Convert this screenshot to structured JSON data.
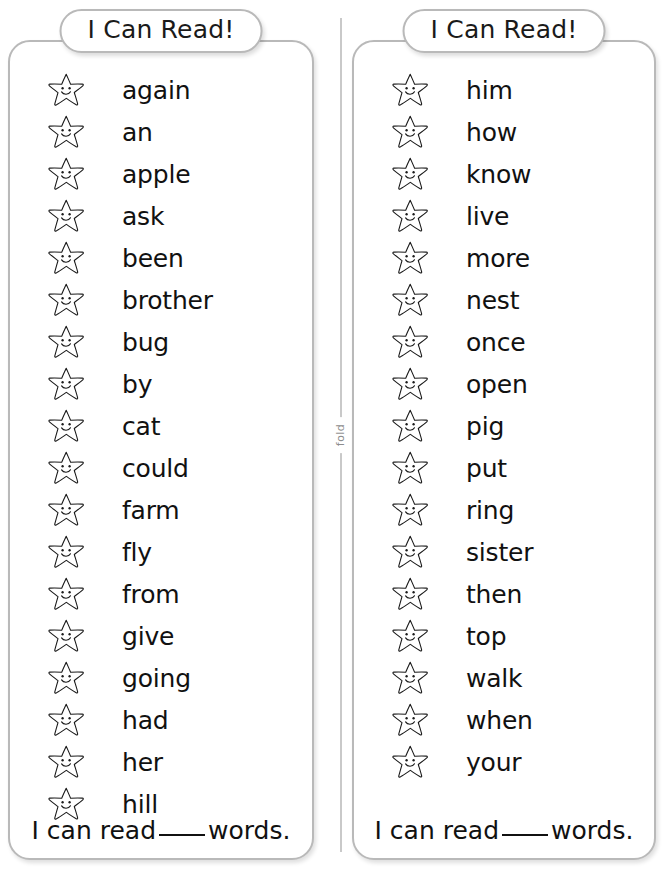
{
  "worksheet": {
    "fold_label": "fold",
    "ink_color": "#111111",
    "card_border_color": "#b9b9b9",
    "fold_line_color": "#c9c9c9"
  },
  "cards": [
    {
      "title": "I Can Read!",
      "star_icon": "smiling-star-icon",
      "words": [
        "again",
        "an",
        "apple",
        "ask",
        "been",
        "brother",
        "bug",
        "by",
        "cat",
        "could",
        "farm",
        "fly",
        "from",
        "give",
        "going",
        "had",
        "her",
        "hill"
      ],
      "footer_prefix": "I can read",
      "footer_blank": "____",
      "footer_suffix": "words."
    },
    {
      "title": "I Can Read!",
      "star_icon": "smiling-star-icon",
      "words": [
        "him",
        "how",
        "know",
        "live",
        "more",
        "nest",
        "once",
        "open",
        "pig",
        "put",
        "ring",
        "sister",
        "then",
        "top",
        "walk",
        "when",
        "your"
      ],
      "footer_prefix": "I can read",
      "footer_blank": "____",
      "footer_suffix": "words."
    }
  ]
}
